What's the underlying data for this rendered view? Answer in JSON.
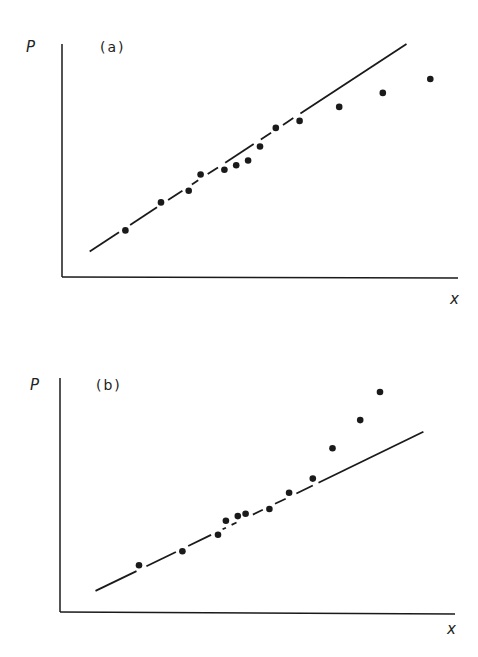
{
  "figure": {
    "background": "#ffffff",
    "ink_color": "#1a1a1a"
  },
  "chart_data": [
    {
      "type": "scatter",
      "panel_label": "(a)",
      "title": "",
      "xlabel": "x",
      "ylabel": "P",
      "grid": false,
      "legend": null,
      "axis_units": "arbitrary (no tick labels)",
      "xlim": [
        0,
        100
      ],
      "ylim": [
        0,
        100
      ],
      "points": [
        {
          "x": 16,
          "y": 20
        },
        {
          "x": 25,
          "y": 32
        },
        {
          "x": 32,
          "y": 37
        },
        {
          "x": 35,
          "y": 44
        },
        {
          "x": 41,
          "y": 46
        },
        {
          "x": 44,
          "y": 48
        },
        {
          "x": 47,
          "y": 50
        },
        {
          "x": 50,
          "y": 56
        },
        {
          "x": 54,
          "y": 64
        },
        {
          "x": 60,
          "y": 67
        },
        {
          "x": 70,
          "y": 73
        },
        {
          "x": 81,
          "y": 79
        },
        {
          "x": 93,
          "y": 85
        }
      ],
      "fit_line": {
        "x0": 7,
        "y0": 11,
        "x1": 87,
        "y1": 100,
        "style": "dashed-segments near points, solid elsewhere"
      },
      "annotation": "Points follow the line at low x, then fall below it at high x (concave deviation)"
    },
    {
      "type": "scatter",
      "panel_label": "(b)",
      "title": "",
      "xlabel": "x",
      "ylabel": "P",
      "grid": false,
      "legend": null,
      "axis_units": "arbitrary (no tick labels)",
      "xlim": [
        0,
        100
      ],
      "ylim": [
        0,
        100
      ],
      "points": [
        {
          "x": 20,
          "y": 20
        },
        {
          "x": 31,
          "y": 26
        },
        {
          "x": 40,
          "y": 33
        },
        {
          "x": 42,
          "y": 39
        },
        {
          "x": 45,
          "y": 41
        },
        {
          "x": 47,
          "y": 42
        },
        {
          "x": 53,
          "y": 44
        },
        {
          "x": 58,
          "y": 51
        },
        {
          "x": 64,
          "y": 57
        },
        {
          "x": 69,
          "y": 70
        },
        {
          "x": 76,
          "y": 82
        },
        {
          "x": 81,
          "y": 94
        }
      ],
      "fit_line": {
        "x0": 9,
        "y0": 9,
        "x1": 92,
        "y1": 77,
        "style": "dashed-segments near points, solid elsewhere"
      },
      "annotation": "Points follow the line at low x, then rise above it at high x (convex deviation)"
    }
  ],
  "panels": {
    "a": {
      "label": "(a)",
      "ylabel": "P",
      "xlabel": "x"
    },
    "b": {
      "label": "(b)",
      "ylabel": "P",
      "xlabel": "x"
    }
  }
}
